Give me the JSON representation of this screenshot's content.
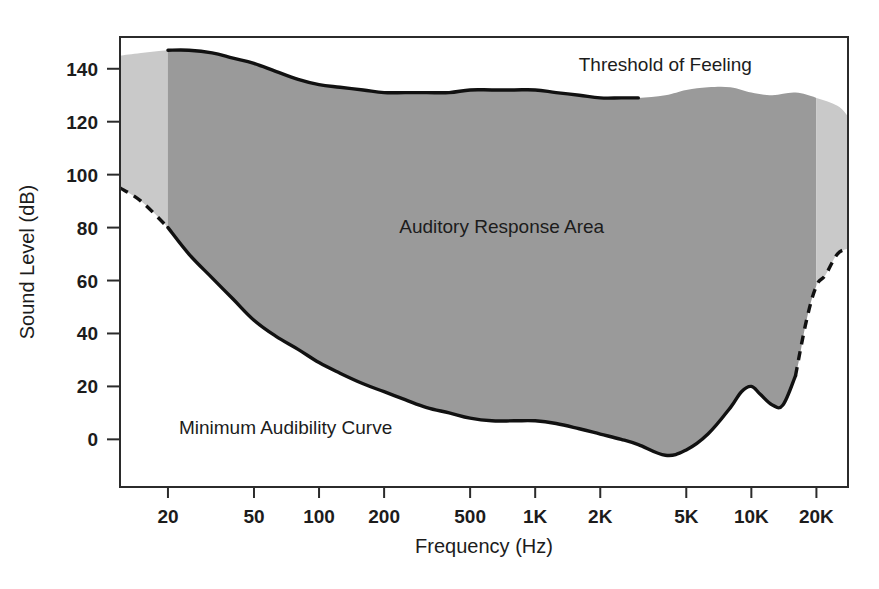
{
  "chart_data": {
    "type": "area",
    "title": "",
    "xlabel": "Frequency (Hz)",
    "ylabel": "Sound Level (dB)",
    "xscale": "log",
    "xlim": [
      12,
      28000
    ],
    "ylim": [
      -18,
      152
    ],
    "grid": false,
    "legend_position": "none",
    "xticks": [
      {
        "value": 20,
        "label": "20"
      },
      {
        "value": 50,
        "label": "50"
      },
      {
        "value": 100,
        "label": "100"
      },
      {
        "value": 200,
        "label": "200"
      },
      {
        "value": 500,
        "label": "500"
      },
      {
        "value": 1000,
        "label": "1K"
      },
      {
        "value": 2000,
        "label": "2K"
      },
      {
        "value": 5000,
        "label": "5K"
      },
      {
        "value": 10000,
        "label": "10K"
      },
      {
        "value": 20000,
        "label": "20K"
      }
    ],
    "yticks": [
      {
        "value": 0,
        "label": "0"
      },
      {
        "value": 20,
        "label": "20"
      },
      {
        "value": 40,
        "label": "40"
      },
      {
        "value": 60,
        "label": "60"
      },
      {
        "value": 80,
        "label": "80"
      },
      {
        "value": 100,
        "label": "100"
      },
      {
        "value": 120,
        "label": "120"
      },
      {
        "value": 140,
        "label": "140"
      }
    ],
    "annotations": [
      {
        "name": "threshold-of-feeling-label",
        "text": "Threshold of Feeling",
        "x": 4000,
        "y": 139
      },
      {
        "name": "auditory-response-area-label",
        "text": "Auditory Response Area",
        "x": 700,
        "y": 78
      },
      {
        "name": "minimum-audibility-curve-label",
        "text": "Minimum Audibility Curve",
        "x": 70,
        "y": 2
      }
    ],
    "series": [
      {
        "name": "Threshold of Feeling",
        "role": "upper-boundary",
        "solid_range_hz": [
          20,
          3000
        ],
        "x": [
          12,
          15,
          20,
          25,
          32,
          40,
          50,
          63,
          80,
          100,
          125,
          160,
          200,
          250,
          315,
          400,
          500,
          630,
          800,
          1000,
          1250,
          1600,
          2000,
          2500,
          3000,
          4000,
          5000,
          6300,
          8000,
          10000,
          12500,
          16000,
          20000,
          25000,
          28000
        ],
        "y": [
          145,
          146,
          147,
          147,
          146,
          144,
          142,
          139,
          136,
          134,
          133,
          132,
          131,
          131,
          131,
          131,
          132,
          132,
          132,
          132,
          131,
          130,
          129,
          129,
          129,
          130,
          132,
          133,
          133,
          131,
          130,
          131,
          129,
          126,
          122
        ]
      },
      {
        "name": "Minimum Audibility Curve",
        "role": "lower-boundary",
        "solid_range_hz": [
          20,
          16000
        ],
        "x": [
          12,
          15,
          20,
          25,
          32,
          40,
          50,
          63,
          80,
          100,
          125,
          160,
          200,
          250,
          315,
          400,
          500,
          630,
          800,
          1000,
          1250,
          1600,
          2000,
          2500,
          3000,
          4000,
          5000,
          6300,
          8000,
          9000,
          10000,
          11000,
          12500,
          14000,
          16000,
          18000,
          20000,
          22000,
          25000,
          28000
        ],
        "y": [
          95,
          90,
          80,
          70,
          61,
          53,
          45,
          39,
          34,
          29,
          25,
          21,
          18,
          15,
          12,
          10,
          8,
          7,
          7,
          7,
          6,
          4,
          2,
          0,
          -2,
          -6,
          -4,
          2,
          12,
          18,
          20,
          17,
          13,
          13,
          24,
          45,
          58,
          62,
          70,
          72
        ]
      }
    ],
    "regions": [
      {
        "name": "extrapolated-low-frequency-band",
        "range_hz": [
          12,
          20
        ],
        "shade": "light"
      },
      {
        "name": "audible-band",
        "range_hz": [
          20,
          20000
        ],
        "shade": "dark"
      },
      {
        "name": "extrapolated-high-frequency-band",
        "range_hz": [
          20000,
          28000
        ],
        "shade": "light"
      }
    ],
    "colors": {
      "dark_fill": "#9a9a9a",
      "light_fill": "#c9c9c9",
      "curve": "#111111",
      "frame": "#2b2b2b",
      "background": "#ffffff",
      "text": "#1c1c1c"
    }
  },
  "figure": {
    "background": "#ffffff"
  }
}
